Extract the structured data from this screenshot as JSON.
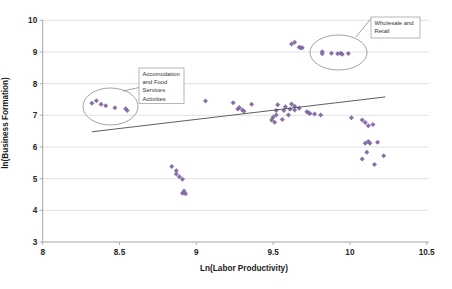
{
  "chart_data": {
    "type": "scatter",
    "title": "",
    "xlabel": "Ln(Labor Productivity)",
    "ylabel": "ln(Business Formation)",
    "xlim": [
      8,
      10.5
    ],
    "ylim": [
      3,
      10
    ],
    "xticks": [
      8,
      8.5,
      9,
      9.5,
      10,
      10.5
    ],
    "xtick_labels": [
      "8",
      "8.5",
      "9",
      "9.5",
      "10",
      "10.5"
    ],
    "yticks": [
      3,
      4,
      5,
      6,
      7,
      8,
      9,
      10
    ],
    "ytick_labels": [
      "3",
      "4",
      "5",
      "6",
      "7",
      "8",
      "9",
      "10"
    ],
    "grid": "horizontal",
    "legend": "none",
    "marker": {
      "shape": "diamond",
      "color": "#8064A2",
      "size": 2.5
    },
    "series": [
      {
        "name": "sector-points",
        "points": [
          [
            8.32,
            7.38
          ],
          [
            8.35,
            7.46
          ],
          [
            8.38,
            7.35
          ],
          [
            8.41,
            7.3
          ],
          [
            8.47,
            7.24
          ],
          [
            8.54,
            7.21
          ],
          [
            8.55,
            7.15
          ],
          [
            8.84,
            5.38
          ],
          [
            8.87,
            5.25
          ],
          [
            8.87,
            5.15
          ],
          [
            8.89,
            5.06
          ],
          [
            8.91,
            4.98
          ],
          [
            8.92,
            4.61
          ],
          [
            8.91,
            4.54
          ],
          [
            8.93,
            4.52
          ],
          [
            9.06,
            7.45
          ],
          [
            9.24,
            7.4
          ],
          [
            9.27,
            7.2
          ],
          [
            9.28,
            7.25
          ],
          [
            9.3,
            7.17
          ],
          [
            9.31,
            7.13
          ],
          [
            9.36,
            7.35
          ],
          [
            9.49,
            6.85
          ],
          [
            9.5,
            6.94
          ],
          [
            9.51,
            6.78
          ],
          [
            9.52,
            7.01
          ],
          [
            9.52,
            7.15
          ],
          [
            9.53,
            7.33
          ],
          [
            9.56,
            6.87
          ],
          [
            9.57,
            7.15
          ],
          [
            9.58,
            7.27
          ],
          [
            9.6,
            7.01
          ],
          [
            9.61,
            7.19
          ],
          [
            9.62,
            7.36
          ],
          [
            9.64,
            7.17
          ],
          [
            9.64,
            7.29
          ],
          [
            9.67,
            7.22
          ],
          [
            9.72,
            7.11
          ],
          [
            9.73,
            7.08
          ],
          [
            9.74,
            7.06
          ],
          [
            9.77,
            7.04
          ],
          [
            9.81,
            7.01
          ],
          [
            9.62,
            9.25
          ],
          [
            9.64,
            9.31
          ],
          [
            9.67,
            9.15
          ],
          [
            9.68,
            9.13
          ],
          [
            9.69,
            9.13
          ],
          [
            9.82,
            9.01
          ],
          [
            9.82,
            8.94
          ],
          [
            9.88,
            8.96
          ],
          [
            9.92,
            8.94
          ],
          [
            9.94,
            8.96
          ],
          [
            9.95,
            8.93
          ],
          [
            9.99,
            8.95
          ],
          [
            10.01,
            6.92
          ],
          [
            10.08,
            6.85
          ],
          [
            10.1,
            6.77
          ],
          [
            10.12,
            6.67
          ],
          [
            10.15,
            6.71
          ],
          [
            10.1,
            6.12
          ],
          [
            10.12,
            6.17
          ],
          [
            10.13,
            6.12
          ],
          [
            10.18,
            6.15
          ],
          [
            10.11,
            5.83
          ],
          [
            10.08,
            5.62
          ],
          [
            10.16,
            5.45
          ],
          [
            10.22,
            5.72
          ]
        ]
      }
    ],
    "trendline": {
      "x1": 8.32,
      "y1": 6.48,
      "x2": 10.23,
      "y2": 7.58,
      "color": "#4d4d4d"
    },
    "annotations": [
      {
        "id": "accommodation",
        "label_lines": [
          "Accomodation",
          "and Food",
          "Services",
          "Activities"
        ],
        "box_px": [
          139,
          68,
          45,
          35.5
        ],
        "ellipse_px": [
          110.5,
          106.5,
          27.5,
          18.5
        ],
        "callout_px": [
          139,
          87.5,
          123,
          91
        ]
      },
      {
        "id": "wholesale-retail",
        "label_lines": [
          "Wholesale and",
          "Retail"
        ],
        "box_px": [
          371,
          17,
          49,
          21
        ],
        "ellipse_px": [
          338.5,
          52.5,
          28.5,
          17.5
        ],
        "callout_px": [
          371,
          18.5,
          356,
          37
        ]
      }
    ],
    "colors": {
      "marker": "#8064A2",
      "gridline": "#D9D9D9",
      "axis": "#A6A6A6",
      "trendline": "#4d4d4d",
      "annotation_border": "#A6A6A6",
      "ellipse_stroke": "#8c8c8c",
      "background": "#FFFFFF"
    }
  }
}
